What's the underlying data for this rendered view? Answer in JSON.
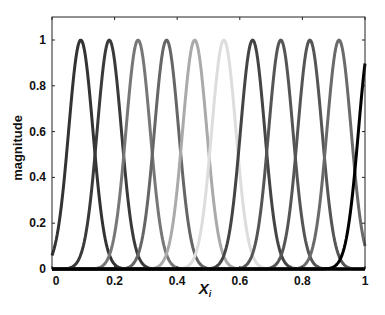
{
  "chart_data": {
    "type": "line",
    "title": "",
    "xlabel": "X",
    "xlabel_subscript": "i",
    "ylabel": "magnitude",
    "xlim": [
      0,
      1
    ],
    "ylim": [
      0,
      1.1
    ],
    "grid": false,
    "legend": null,
    "x_ticks": [
      0,
      0.2,
      0.4,
      0.6,
      0.8,
      1
    ],
    "x_tick_labels": [
      "0",
      "0.2",
      "0.4",
      "0.6",
      "0.8",
      "1"
    ],
    "y_ticks": [
      0,
      0.2,
      0.4,
      0.6,
      0.8,
      1
    ],
    "y_tick_labels": [
      "0",
      "0.2",
      "0.4",
      "0.6",
      "0.8",
      "1"
    ],
    "curve_shape": "gaussian",
    "sigma": 0.0387,
    "series": [
      {
        "name": "basis 1",
        "center": 0.092,
        "peak": 1.0,
        "color": "#333333"
      },
      {
        "name": "basis 2",
        "center": 0.183,
        "peak": 1.0,
        "color": "#3a3a3a"
      },
      {
        "name": "basis 3",
        "center": 0.275,
        "peak": 1.0,
        "color": "#777777"
      },
      {
        "name": "basis 4",
        "center": 0.366,
        "peak": 1.0,
        "color": "#666666"
      },
      {
        "name": "basis 5",
        "center": 0.456,
        "peak": 1.0,
        "color": "#aaaaaa"
      },
      {
        "name": "basis 6",
        "center": 0.549,
        "peak": 1.0,
        "color": "#dddddd"
      },
      {
        "name": "basis 7",
        "center": 0.641,
        "peak": 1.0,
        "color": "#444444"
      },
      {
        "name": "basis 8",
        "center": 0.731,
        "peak": 1.0,
        "color": "#555555"
      },
      {
        "name": "basis 9",
        "center": 0.824,
        "peak": 1.0,
        "color": "#555555"
      },
      {
        "name": "basis 10",
        "center": 0.917,
        "peak": 1.0,
        "color": "#6a6a6a"
      },
      {
        "name": "basis 11",
        "center": 1.018,
        "peak": 1.0,
        "color": "#000000"
      }
    ]
  }
}
